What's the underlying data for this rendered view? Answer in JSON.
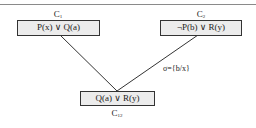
{
  "diagram": {
    "type": "resolution-tree",
    "nodes": [
      {
        "id": "C1",
        "label_main": "C",
        "label_sub": "1",
        "clause": "P(x) ∨ Q(a)"
      },
      {
        "id": "C2",
        "label_main": "C",
        "label_sub": "2",
        "clause": "¬P(b) ∨ R(y)"
      },
      {
        "id": "C12",
        "label_main": "C",
        "label_sub": "12",
        "clause": "Q(a) ∨ R(y)"
      }
    ],
    "edges": [
      {
        "from": "C1",
        "to": "C12"
      },
      {
        "from": "C2",
        "to": "C12",
        "annotation": "σ={b/x}"
      }
    ],
    "colors": {
      "box_fill": "#ececec",
      "box_border": "#333333",
      "line": "#333333",
      "rule": "#8a8a8a"
    }
  }
}
